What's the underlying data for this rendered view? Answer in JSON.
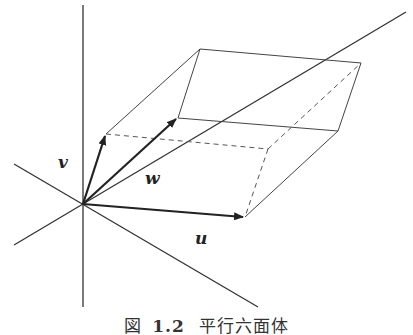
{
  "figure": {
    "caption_label": "図",
    "caption_number": "1.2",
    "caption_text": "平行六面体"
  },
  "labels": {
    "v": "v",
    "w": "w",
    "u": "u"
  },
  "colors": {
    "line": "#333333",
    "arrow": "#222222",
    "background": "#ffffff"
  }
}
